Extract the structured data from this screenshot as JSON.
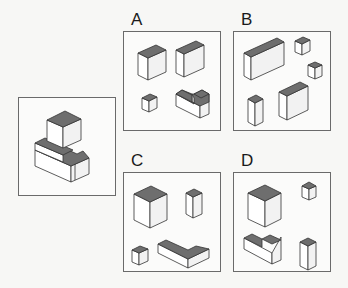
{
  "puzzle": {
    "type": "spatial-reasoning",
    "question_figure": {
      "description": "assembled isometric block structure"
    },
    "options": [
      {
        "label": "A",
        "pieces": [
          "tall block",
          "tall block",
          "small cube",
          "notched L block"
        ]
      },
      {
        "label": "B",
        "pieces": [
          "long flat block",
          "small cube",
          "small cube",
          "narrow tall block",
          "medium block"
        ]
      },
      {
        "label": "C",
        "pieces": [
          "large cube",
          "narrow tall block",
          "small cube",
          "L-shaped slab"
        ]
      },
      {
        "label": "D",
        "pieces": [
          "large cube",
          "small cube",
          "notched L block",
          "tall pillar"
        ]
      }
    ]
  },
  "colors": {
    "top_face": "#6e6e6e",
    "side_face": "#ffffff",
    "outline": "#333333",
    "frame": "#6a6a6a"
  }
}
